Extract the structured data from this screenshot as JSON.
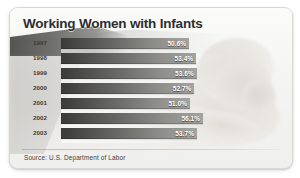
{
  "card": {
    "title": "Working Women with Infants",
    "source": "Source: U.S. Department of Labor",
    "border_color": "#d8d8d6",
    "background_color": "#f7f7f6",
    "title_color": "#2e2e2c",
    "bar_color_dark": "#3a3a38",
    "bar_color_light": "#a3a3a0",
    "value_text_color": "#ffffff"
  },
  "chart_data": {
    "type": "bar",
    "orientation": "horizontal",
    "title": "Working Women with Infants",
    "xlabel": "",
    "ylabel": "",
    "categories": [
      "1997",
      "1998",
      "1999",
      "2000",
      "2001",
      "2002",
      "2003"
    ],
    "values": [
      50.6,
      53.4,
      53.6,
      52.7,
      51.0,
      56.1,
      53.7
    ],
    "value_labels": [
      "50.6%",
      "53.4%",
      "53.6%",
      "52.7%",
      "51.0%",
      "56.1%",
      "53.7%"
    ],
    "xlim": [
      0,
      56.1
    ],
    "grid": false,
    "legend": null,
    "units": "percent",
    "source": "Source: U.S. Department of Labor"
  }
}
